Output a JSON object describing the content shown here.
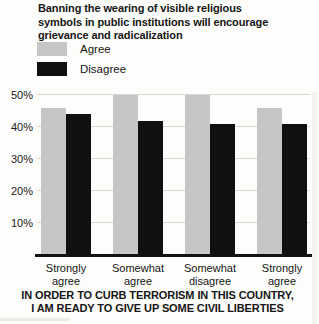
{
  "chart_data": {
    "type": "bar",
    "title": "Banning the wearing of visible religious\nsymbols in public institutions will encourage\ngrievance and radicalization",
    "categories": [
      "Strongly agree",
      "Somewhat agree",
      "Somewhat disagree",
      "Strongly agree"
    ],
    "series": [
      {
        "name": "Agree",
        "color": "#c6c6c6",
        "values": [
          46,
          50,
          50,
          46
        ]
      },
      {
        "name": "Disagree",
        "color": "#101010",
        "values": [
          44,
          42,
          41,
          41
        ]
      }
    ],
    "ytick_labels": [
      "50%",
      "40%",
      "30%",
      "20%",
      "10%"
    ],
    "ytick_values": [
      50,
      40,
      30,
      20,
      10
    ],
    "ylim": [
      0,
      52
    ],
    "grid": true,
    "legend_position": "top-left",
    "xlabel": "IN ORDER TO CURB TERRORISM IN THIS COUNTRY,\nI AM READY TO GIVE UP SOME CIVIL LIBERTIES",
    "ylabel": "",
    "axis_color": "#121212",
    "gridline_color": "#d6d6d3"
  }
}
